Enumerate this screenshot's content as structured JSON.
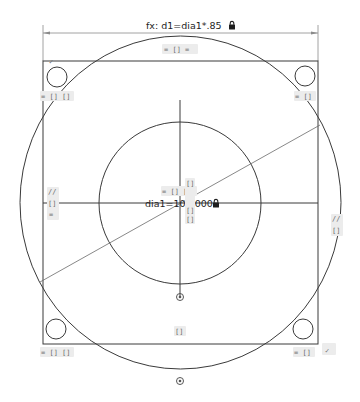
{
  "app": {
    "view": "sketch-canvas"
  },
  "colors": {
    "geometry": "#3a3a3a",
    "dimension": "#8a8a8a",
    "constraint_glyph": "#6c6c6c",
    "glyph_bg": "#ececec",
    "background": "#ffffff"
  },
  "dimensions": {
    "top": {
      "label": "fx: d1=dia1*.85",
      "locked": true
    },
    "center": {
      "label": "dia1=10.0000",
      "locked": true
    }
  },
  "constraints": {
    "top_edge": "= [] =",
    "top_left": "= [] []",
    "top_right": "= []",
    "left_parallel": "//",
    "left_mid": "[]",
    "left_equal": "=",
    "right_parallel": "//",
    "right_mid": "[]",
    "bottom_left": "= [] []",
    "bottom_right": "= []",
    "bottom_mid": "[]",
    "center_row": "= [] []",
    "center_stack_1": "[]",
    "center_stack_2": "[]",
    "center_stack_3": "[]",
    "corner_tangent_tl": "✓",
    "corner_tangent_br": "✓"
  },
  "icons": {
    "lock": "lock-icon",
    "origin": "origin-icon"
  }
}
